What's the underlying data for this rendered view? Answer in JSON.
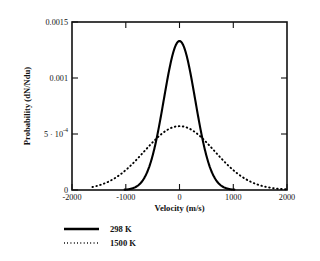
{
  "chart_data": {
    "type": "line",
    "title": "",
    "xlabel": "Velocity (m/s)",
    "ylabel": "Probability (dN/Ndu)",
    "xlim": [
      -2000,
      2000
    ],
    "ylim": [
      0,
      0.0015
    ],
    "grid": false,
    "legend_position": "below-left",
    "xticks": [
      -2000,
      -1000,
      0,
      1000,
      2000
    ],
    "xtick_labels": [
      "-2000",
      "-1000",
      "0",
      "1000",
      "2000"
    ],
    "yticks": [
      0,
      0.0005,
      0.001,
      0.0015
    ],
    "ytick_labels": [
      "0",
      "5 · 10",
      "0.001",
      "0.0015"
    ],
    "ytick_label_exponent": "-4",
    "series": [
      {
        "name": "298 K",
        "style": "solid",
        "color": "#000000",
        "peak_value": 0.00133,
        "peak_x": 0,
        "sigma": 292,
        "x": [
          -1000,
          -900,
          -800,
          -700,
          -600,
          -500,
          -400,
          -300,
          -200,
          -100,
          0,
          100,
          200,
          300,
          400,
          500,
          600,
          700,
          800,
          900,
          1000
        ],
        "values": [
          0.0,
          1e-07,
          1.3e-06,
          1.5e-05,
          0.000106,
          0.000428,
          0.000106,
          1.5e-05,
          1.3e-06,
          1e-07,
          0.0,
          1e-07,
          1.3e-06,
          1.5e-05,
          0.000106,
          0.000428,
          0.000106,
          1.5e-05,
          1.3e-06,
          1e-07,
          0.0
        ]
      },
      {
        "name": "1500 K",
        "style": "dotted",
        "color": "#000000",
        "peak_value": 0.00057,
        "peak_x": 0,
        "sigma": 655,
        "x": [
          -1600,
          -1400,
          -1200,
          -1000,
          -800,
          -600,
          -400,
          -200,
          0,
          200,
          400,
          600,
          800,
          1000,
          1200,
          1400,
          1600,
          1800,
          2000
        ],
        "values": [
          2.9e-05,
          5.8e-05,
          0.000106,
          0.000176,
          0.000267,
          0.00037,
          0.000468,
          0.000541,
          0.00057,
          0.000541,
          0.000468,
          0.00037,
          0.000267,
          0.000176,
          0.000106,
          5.8e-05,
          2.9e-05,
          1.3e-05,
          5e-06
        ]
      }
    ]
  },
  "legend": {
    "entries": [
      {
        "label": "298 K",
        "style": "solid"
      },
      {
        "label": "1500 K",
        "style": "dotted"
      }
    ]
  }
}
